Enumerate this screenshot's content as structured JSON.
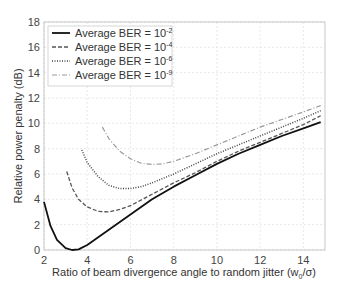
{
  "chart_data": {
    "type": "line",
    "title": "",
    "xlabel": "Ratio of beam divergence angle to random jitter (w0/σ)",
    "ylabel": "Relative power penalty (dB)",
    "xlim": [
      2,
      15
    ],
    "ylim": [
      0,
      18
    ],
    "xticks": [
      2,
      4,
      6,
      8,
      10,
      12,
      14
    ],
    "yticks": [
      0,
      2,
      4,
      6,
      8,
      10,
      12,
      14,
      16,
      18
    ],
    "grid": true,
    "legend_position": "upper left",
    "series": [
      {
        "name": "Average BER = 10^-2",
        "style": "solid",
        "x": [
          2.0,
          2.3,
          2.6,
          3.0,
          3.3,
          3.6,
          4.0,
          5.0,
          6.0,
          7.0,
          8.0,
          9.0,
          10.0,
          11.0,
          12.0,
          13.0,
          14.0,
          14.8
        ],
        "y": [
          3.8,
          1.9,
          0.8,
          0.15,
          0.0,
          0.05,
          0.4,
          1.6,
          2.8,
          4.0,
          5.0,
          5.9,
          6.8,
          7.6,
          8.3,
          9.0,
          9.6,
          10.1
        ]
      },
      {
        "name": "Average BER = 10^-4",
        "style": "dashed",
        "x": [
          3.05,
          3.3,
          3.6,
          4.0,
          4.5,
          5.0,
          5.5,
          6.0,
          7.0,
          8.0,
          9.0,
          10.0,
          11.0,
          12.0,
          13.0,
          14.0,
          14.8
        ],
        "y": [
          6.2,
          4.9,
          4.0,
          3.4,
          3.05,
          3.0,
          3.2,
          3.5,
          4.4,
          5.3,
          6.1,
          7.0,
          7.8,
          8.5,
          9.2,
          9.9,
          10.6
        ]
      },
      {
        "name": "Average BER = 10^-6",
        "style": "dotted",
        "x": [
          3.75,
          4.0,
          4.5,
          5.0,
          5.5,
          6.0,
          6.5,
          7.0,
          8.0,
          9.0,
          10.0,
          11.0,
          12.0,
          13.0,
          14.0,
          14.8
        ],
        "y": [
          7.9,
          6.9,
          5.8,
          5.1,
          4.85,
          4.85,
          5.0,
          5.3,
          6.0,
          6.8,
          7.6,
          8.3,
          9.0,
          9.7,
          10.4,
          11.0
        ]
      },
      {
        "name": "Average BER = 10^-9",
        "style": "dash-dot",
        "x": [
          4.7,
          5.0,
          5.5,
          6.0,
          6.5,
          7.0,
          7.5,
          8.0,
          9.0,
          10.0,
          11.0,
          12.0,
          13.0,
          14.0,
          14.8
        ],
        "y": [
          9.7,
          8.8,
          7.8,
          7.2,
          6.85,
          6.75,
          6.8,
          7.0,
          7.6,
          8.3,
          9.0,
          9.7,
          10.3,
          10.9,
          11.4
        ]
      }
    ]
  },
  "axes": {
    "xlabel_main": "Ratio of beam divergence angle to random jitter (w",
    "xlabel_sub": "0",
    "xlabel_tail": "/σ)",
    "ylabel": "Relative power penalty (dB)"
  },
  "legend": [
    {
      "label": "Average BER = 10",
      "exp": "-2"
    },
    {
      "label": "Average BER = 10",
      "exp": "-4"
    },
    {
      "label": "Average BER = 10",
      "exp": "-6"
    },
    {
      "label": "Average BER = 10",
      "exp": "-9"
    }
  ]
}
